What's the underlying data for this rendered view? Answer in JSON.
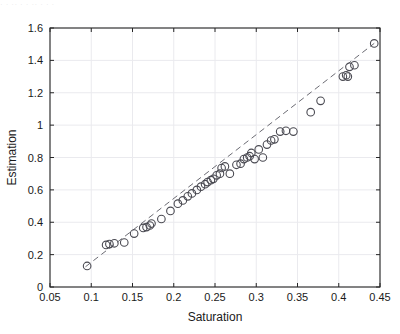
{
  "figure": {
    "top_artifact_text": "· · ·· · · ·· · · ·",
    "background_color": "#ffffff",
    "axis_color": "#262626",
    "grid_color": "#eaeaee",
    "marker_edge_color": "#4a4a52",
    "fit_line_color": "#6b6b73"
  },
  "chart_data": {
    "type": "scatter",
    "title": "",
    "xlabel": "Saturation",
    "ylabel": "Estimation",
    "xlim": [
      0.05,
      0.45
    ],
    "ylim": [
      0,
      1.6
    ],
    "xticks": [
      0.05,
      0.1,
      0.15,
      0.2,
      0.25,
      0.3,
      0.35,
      0.4,
      0.45
    ],
    "xticklabels": [
      "0.05",
      "0.1",
      "0.15",
      "0.2",
      "0.25",
      "0.3",
      "0.35",
      "0.4",
      "0.45"
    ],
    "yticks": [
      0,
      0.2,
      0.4,
      0.6,
      0.8,
      1,
      1.2,
      1.4,
      1.6
    ],
    "yticklabels": [
      "0",
      "0.2",
      "0.4",
      "0.6",
      "0.8",
      "1",
      "1.2",
      "1.4",
      "1.6"
    ],
    "grid": true,
    "legend": null,
    "marker": "circle-open",
    "marker_size": 5,
    "fit_line": {
      "style": "dashed",
      "x": [
        0.093,
        0.443
      ],
      "y": [
        0.125,
        1.505
      ]
    },
    "points": [
      {
        "x": 0.095,
        "y": 0.13
      },
      {
        "x": 0.118,
        "y": 0.26
      },
      {
        "x": 0.122,
        "y": 0.265
      },
      {
        "x": 0.128,
        "y": 0.27
      },
      {
        "x": 0.14,
        "y": 0.275
      },
      {
        "x": 0.152,
        "y": 0.33
      },
      {
        "x": 0.163,
        "y": 0.365
      },
      {
        "x": 0.167,
        "y": 0.37
      },
      {
        "x": 0.171,
        "y": 0.38
      },
      {
        "x": 0.173,
        "y": 0.392
      },
      {
        "x": 0.185,
        "y": 0.42
      },
      {
        "x": 0.196,
        "y": 0.47
      },
      {
        "x": 0.205,
        "y": 0.515
      },
      {
        "x": 0.211,
        "y": 0.535
      },
      {
        "x": 0.217,
        "y": 0.56
      },
      {
        "x": 0.222,
        "y": 0.578
      },
      {
        "x": 0.228,
        "y": 0.6
      },
      {
        "x": 0.233,
        "y": 0.62
      },
      {
        "x": 0.238,
        "y": 0.635
      },
      {
        "x": 0.241,
        "y": 0.648
      },
      {
        "x": 0.245,
        "y": 0.66
      },
      {
        "x": 0.248,
        "y": 0.668
      },
      {
        "x": 0.252,
        "y": 0.69
      },
      {
        "x": 0.256,
        "y": 0.7
      },
      {
        "x": 0.258,
        "y": 0.735
      },
      {
        "x": 0.262,
        "y": 0.745
      },
      {
        "x": 0.268,
        "y": 0.7
      },
      {
        "x": 0.276,
        "y": 0.755
      },
      {
        "x": 0.281,
        "y": 0.762
      },
      {
        "x": 0.285,
        "y": 0.79
      },
      {
        "x": 0.289,
        "y": 0.8
      },
      {
        "x": 0.292,
        "y": 0.808
      },
      {
        "x": 0.294,
        "y": 0.828
      },
      {
        "x": 0.298,
        "y": 0.79
      },
      {
        "x": 0.303,
        "y": 0.85
      },
      {
        "x": 0.308,
        "y": 0.8
      },
      {
        "x": 0.313,
        "y": 0.88
      },
      {
        "x": 0.318,
        "y": 0.905
      },
      {
        "x": 0.322,
        "y": 0.912
      },
      {
        "x": 0.329,
        "y": 0.96
      },
      {
        "x": 0.336,
        "y": 0.965
      },
      {
        "x": 0.345,
        "y": 0.96
      },
      {
        "x": 0.366,
        "y": 1.08
      },
      {
        "x": 0.378,
        "y": 1.15
      },
      {
        "x": 0.405,
        "y": 1.3
      },
      {
        "x": 0.409,
        "y": 1.308
      },
      {
        "x": 0.411,
        "y": 1.3
      },
      {
        "x": 0.413,
        "y": 1.36
      },
      {
        "x": 0.419,
        "y": 1.37
      },
      {
        "x": 0.443,
        "y": 1.505
      }
    ]
  }
}
